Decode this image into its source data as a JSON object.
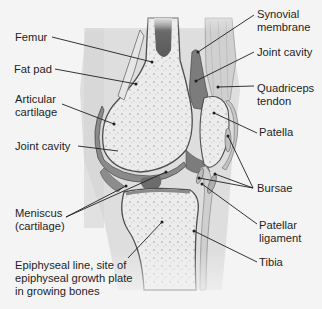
{
  "diagram": {
    "colors": {
      "background": "#f4f4f4",
      "soft_tissue": "#e2e2e2",
      "bone_fill": "#e9e9e9",
      "bone_outline": "#5a5a5a",
      "marrow_cavity": "#6e6e6e",
      "cartilage": "#8c8c8c",
      "synovial": "#7a7a7a",
      "leader_line": "#1e1e1e",
      "text": "#1e1e1e"
    },
    "labels_left": [
      {
        "id": "femur",
        "text": "Femur"
      },
      {
        "id": "fat-pad",
        "text": "Fat pad"
      },
      {
        "id": "articular-cartilage-1",
        "text": "Articular"
      },
      {
        "id": "articular-cartilage-2",
        "text": "cartilage"
      },
      {
        "id": "joint-cavity-left",
        "text": "Joint cavity"
      },
      {
        "id": "meniscus-1",
        "text": "Meniscus"
      },
      {
        "id": "meniscus-2",
        "text": "(cartilage)"
      },
      {
        "id": "epiphyseal-1",
        "text": "Epiphyseal line, site of"
      },
      {
        "id": "epiphyseal-2",
        "text": "epiphyseal growth plate"
      },
      {
        "id": "epiphyseal-3",
        "text": "in growing bones"
      }
    ],
    "labels_right": [
      {
        "id": "synovial-1",
        "text": "Synovial"
      },
      {
        "id": "synovial-2",
        "text": "membrane"
      },
      {
        "id": "joint-cavity-right",
        "text": "Joint cavity"
      },
      {
        "id": "quadriceps-1",
        "text": "Quadriceps"
      },
      {
        "id": "quadriceps-2",
        "text": "tendon"
      },
      {
        "id": "patella",
        "text": "Patella"
      },
      {
        "id": "bursae",
        "text": "Bursae"
      },
      {
        "id": "patellar-ligament-1",
        "text": "Patellar"
      },
      {
        "id": "patellar-ligament-2",
        "text": "ligament"
      },
      {
        "id": "tibia",
        "text": "Tibia"
      }
    ]
  }
}
